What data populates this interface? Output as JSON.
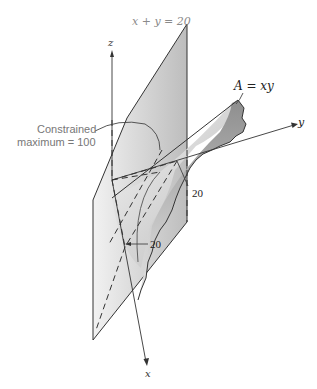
{
  "figure": {
    "axes": {
      "x_label": "x",
      "y_label": "y",
      "z_label": "z"
    },
    "constraint_label": "x + y = 20",
    "surface_label": "A = xy",
    "annotation": {
      "line1": "Constrained",
      "line2": "maximum = 100"
    },
    "tick_labels": {
      "y_intercept": "20",
      "x_intercept": "20"
    },
    "colors": {
      "plane_fill": "#d9d9d9",
      "surface_fill": "#c4c4c4",
      "line": "#333333",
      "label_gray": "#8a8a8a"
    }
  }
}
